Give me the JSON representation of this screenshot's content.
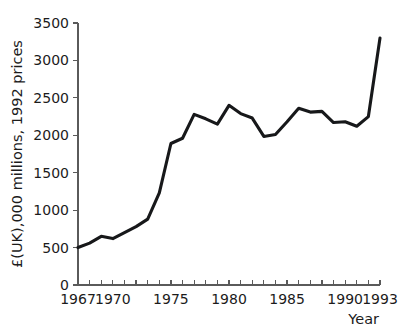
{
  "chart_data": {
    "type": "line",
    "title": "",
    "subtitle": "",
    "xlabel": "Year",
    "ylabel": "£(UK),000 millions, 1992 prices",
    "xlim": [
      1967,
      1993
    ],
    "ylim": [
      0,
      3500
    ],
    "grid": false,
    "legend": null,
    "legend_position": "none",
    "y_ticks": [
      0,
      500,
      1000,
      1500,
      2000,
      2500,
      3000,
      3500
    ],
    "y_tick_labels": [
      "0",
      "500",
      "1000",
      "1500",
      "2000",
      "2500",
      "3000",
      "3500"
    ],
    "x_ticks": [
      1967,
      1968,
      1969,
      1970,
      1971,
      1972,
      1973,
      1974,
      1975,
      1976,
      1977,
      1978,
      1979,
      1980,
      1981,
      1982,
      1983,
      1984,
      1985,
      1986,
      1987,
      1988,
      1989,
      1990,
      1991,
      1992,
      1993
    ],
    "x_tick_labels_shown": [
      "1967",
      "1970",
      "1975",
      "1980",
      "1985",
      "1990",
      "1993"
    ],
    "x_labeled_ticks": [
      1967,
      1970,
      1975,
      1980,
      1985,
      1990,
      1993
    ],
    "series": [
      {
        "name": "£(UK),000 millions, 1992 prices",
        "color": "#17181a",
        "x": [
          1967,
          1968,
          1969,
          1970,
          1971,
          1972,
          1973,
          1974,
          1975,
          1976,
          1977,
          1978,
          1979,
          1980,
          1981,
          1982,
          1983,
          1984,
          1985,
          1986,
          1987,
          1988,
          1989,
          1990,
          1991,
          1992,
          1993
        ],
        "values": [
          500,
          560,
          650,
          620,
          700,
          780,
          880,
          1230,
          1890,
          1960,
          2280,
          2220,
          2150,
          2400,
          2290,
          2230,
          1985,
          2010,
          2180,
          2360,
          2310,
          2320,
          2170,
          2180,
          2120,
          2250,
          3300
        ]
      }
    ],
    "axis_color": "#5a5a5a",
    "line_color": "#17181a",
    "background_color": "#ffffff"
  },
  "axis_labels": {
    "y_axis_title": "£(UK),000 millions, 1992 prices",
    "x_axis_title": "Year"
  }
}
